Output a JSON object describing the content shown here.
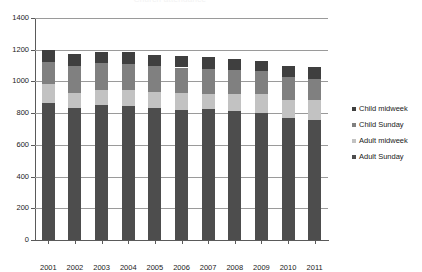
{
  "chart_data": {
    "type": "bar",
    "subtype": "stacked-bar",
    "title": "Church attendance",
    "xlabel": "",
    "ylabel": "",
    "ylim": [
      0,
      1400
    ],
    "ytick_step": 200,
    "yticks": [
      0,
      200,
      400,
      600,
      800,
      1000,
      1200,
      1400
    ],
    "ytick_labels": [
      "0",
      "200",
      "400",
      "600",
      "800",
      "1000",
      "1200",
      "1400"
    ],
    "grid": true,
    "legend_position": "right",
    "categories": [
      "2001",
      "2002",
      "2003",
      "2004",
      "2005",
      "2006",
      "2007",
      "2008",
      "2009",
      "2010",
      "2011"
    ],
    "series": [
      {
        "name": "Adult Sunday",
        "color": "#4d4d4d",
        "values": [
          865,
          835,
          850,
          843,
          833,
          823,
          825,
          812,
          800,
          770,
          760
        ]
      },
      {
        "name": "Adult midweek",
        "color": "#c2c2c2",
        "values": [
          120,
          95,
          95,
          100,
          100,
          105,
          95,
          110,
          120,
          115,
          120
        ]
      },
      {
        "name": "Child Sunday",
        "color": "#808080",
        "values": [
          140,
          165,
          170,
          170,
          165,
          160,
          160,
          150,
          145,
          145,
          135
        ]
      },
      {
        "name": "Child midweek",
        "color": "#3f3f3f",
        "values": [
          75,
          75,
          70,
          70,
          70,
          75,
          75,
          70,
          65,
          65,
          75
        ]
      }
    ],
    "totals": [
      1200,
      1170,
      1185,
      1183,
      1168,
      1163,
      1155,
      1142,
      1130,
      1095,
      1090
    ]
  },
  "legend": {
    "items": [
      {
        "label": "Child midweek",
        "color": "#3f3f3f"
      },
      {
        "label": "Child Sunday",
        "color": "#808080"
      },
      {
        "label": "Adult midweek",
        "color": "#c2c2c2"
      },
      {
        "label": "Adult Sunday",
        "color": "#4d4d4d"
      }
    ]
  }
}
